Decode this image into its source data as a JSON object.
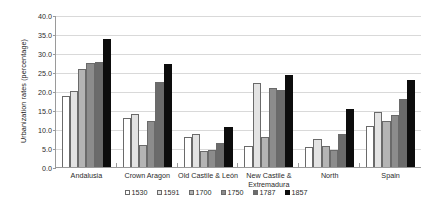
{
  "chart_data": {
    "type": "bar",
    "title": "",
    "xlabel": "",
    "ylabel": "Urbanization rates (percentage)",
    "ylim": [
      0,
      40
    ],
    "ytick_labels": [
      "0.0",
      "5.0",
      "10.0",
      "15.0",
      "20.0",
      "25.0",
      "30.0",
      "35.0",
      "40.0"
    ],
    "ytick_values": [
      0,
      5,
      10,
      15,
      20,
      25,
      30,
      35,
      40
    ],
    "grid": true,
    "legend_position": "bottom",
    "categories": [
      "Andalusia",
      "Crown Aragon",
      "Old Castile & León",
      "New Castile & Extremadura",
      "North",
      "Spain"
    ],
    "series": [
      {
        "name": "1530",
        "color": "#ffffff",
        "values": [
          18.6,
          13.0,
          7.9,
          5.5,
          5.2,
          10.7
        ]
      },
      {
        "name": "1591",
        "color": "#e3e3e3",
        "values": [
          20.0,
          14.0,
          8.8,
          22.2,
          7.3,
          14.6
        ]
      },
      {
        "name": "1700",
        "color": "#b4b4b4",
        "values": [
          25.8,
          5.7,
          4.1,
          7.8,
          5.6,
          12.2
        ]
      },
      {
        "name": "1750",
        "color": "#8c8c8c",
        "values": [
          27.4,
          12.0,
          4.6,
          20.8,
          4.6,
          13.6
        ]
      },
      {
        "name": "1787",
        "color": "#6b6b6b",
        "values": [
          27.7,
          22.5,
          6.3,
          20.2,
          8.6,
          17.8
        ]
      },
      {
        "name": "1857",
        "color": "#0d0d0d",
        "values": [
          33.8,
          27.0,
          10.6,
          24.3,
          15.3,
          22.8
        ]
      }
    ]
  }
}
